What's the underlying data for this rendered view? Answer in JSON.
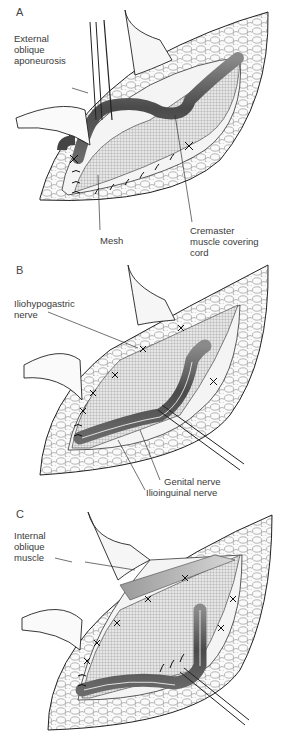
{
  "figure": {
    "panels": [
      {
        "letter": "A",
        "labels": {
          "external_oblique": "External\noblique\naponeurosis",
          "mesh": "Mesh",
          "cremaster": "Cremaster\nmuscle covering\ncord"
        }
      },
      {
        "letter": "B",
        "labels": {
          "iliohypogastric": "Iliohypogastric\nnerve",
          "genital": "Genital nerve",
          "ilioinguinal": "Ilioinguinal nerve"
        }
      },
      {
        "letter": "C",
        "labels": {
          "internal_oblique": "Internal\noblique\nmuscle"
        }
      }
    ]
  },
  "colors": {
    "background": "#ffffff",
    "line": "#222222",
    "cord": "#5a5a5a",
    "mesh": "#cfcfcf",
    "tissue": "#f2f2f2"
  }
}
